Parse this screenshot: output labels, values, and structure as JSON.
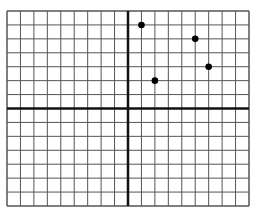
{
  "chart_data": {
    "type": "scatter",
    "title": "",
    "xlabel": "",
    "ylabel": "",
    "xlim": [
      -9,
      9
    ],
    "ylim": [
      -7,
      7
    ],
    "grid": true,
    "legend": null,
    "series": [
      {
        "name": "points",
        "x": [
          1,
          5,
          6,
          2
        ],
        "y": [
          6,
          5,
          3,
          2
        ]
      }
    ]
  },
  "layout": {
    "left": 7,
    "top": 11,
    "right": 249,
    "bottom": 206,
    "grid_color": "#555555",
    "axis_color": "#111111",
    "point_color": "#000000"
  }
}
